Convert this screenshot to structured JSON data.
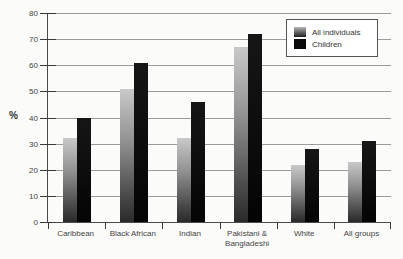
{
  "chart_data": {
    "type": "bar",
    "title": "",
    "ylabel": "%",
    "xlabel": "",
    "ylim": [
      0,
      80
    ],
    "ytick_step": 10,
    "yticks": [
      0,
      10,
      20,
      30,
      40,
      50,
      60,
      70,
      80
    ],
    "grid": true,
    "legend_position": "top-right",
    "categories": [
      "Caribbean",
      "Black African",
      "Indian",
      "Pakistani & Bangladeshi",
      "White",
      "All groups"
    ],
    "category_label_lines": [
      [
        "Caribbean"
      ],
      [
        "Black African"
      ],
      [
        "Indian"
      ],
      [
        "Pakistani &",
        "Bangladeshi"
      ],
      [
        "White"
      ],
      [
        "All groups"
      ]
    ],
    "series": [
      {
        "name": "All individuals",
        "values": [
          32,
          51,
          32,
          67,
          22,
          23
        ]
      },
      {
        "name": "Children",
        "values": [
          40,
          61,
          46,
          72,
          28,
          31
        ]
      }
    ]
  },
  "colors": {
    "background": "#fbfbf9",
    "gridline": "#9b9b9b",
    "axis": "#4a4a4a",
    "text": "#444444",
    "bar_all_individuals_top": "#c9c9c9",
    "bar_all_individuals_bottom": "#2a2a2a",
    "bar_children": "#0a0a0a",
    "legend_border": "#555555",
    "legend_background": "#ffffff"
  }
}
